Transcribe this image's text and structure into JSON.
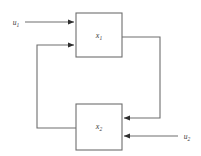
{
  "figure": {
    "background_color": "#ffffff",
    "line_color": "#6e6e6e",
    "text_color": "#3a3a3a"
  },
  "blocks": [
    {
      "id": "block-x1",
      "label_base": "x",
      "label_sub": "1",
      "x": 76,
      "y": 13,
      "width": 46,
      "height": 44
    },
    {
      "id": "block-x2",
      "label_base": "x",
      "label_sub": "2",
      "x": 76,
      "y": 104,
      "width": 46,
      "height": 46
    }
  ],
  "inputs": [
    {
      "id": "input-u1",
      "label_base": "u",
      "label_sub": "1",
      "label_x": 16,
      "label_y": 25,
      "line_from_x": 25,
      "line_to_x": 74,
      "line_y": 22,
      "target_block": "block-x1",
      "direction": "right"
    },
    {
      "id": "input-u2",
      "label_base": "u",
      "label_sub": "2",
      "label_x": 182,
      "label_y": 139,
      "line_from_x": 178,
      "line_to_x": 124,
      "line_y": 136,
      "target_block": "block-x2",
      "direction": "left"
    }
  ],
  "signals": [
    {
      "id": "feedback-x1-to-x2",
      "description": "Output of block x1 routed right, down, then left into block x2",
      "points": "122,37 160,37 160,118 124,118",
      "arrow_at": "124,118",
      "arrow_direction": "left"
    },
    {
      "id": "feedback-x2-to-x1",
      "description": "Output of block x2 routed left, up, then right into block x1",
      "points": "76,128 37,128 37,45 74,45",
      "arrow_at": "74,45",
      "arrow_direction": "right"
    }
  ]
}
